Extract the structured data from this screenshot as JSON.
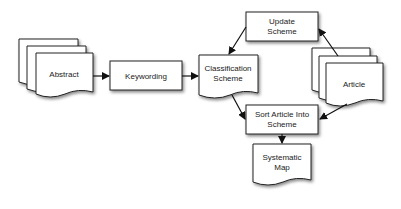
{
  "diagram": {
    "type": "flowchart",
    "nodes": {
      "abstract": {
        "label": "Abstract",
        "shape": "multi-document"
      },
      "keywording": {
        "label": "Keywording",
        "shape": "process"
      },
      "classification": {
        "line1": "Classification",
        "line2": "Scheme",
        "shape": "document"
      },
      "update": {
        "line1": "Update",
        "line2": "Scheme",
        "shape": "process"
      },
      "article": {
        "label": "Article",
        "shape": "multi-document"
      },
      "sort": {
        "line1": "Sort Article Into",
        "line2": "Scheme",
        "shape": "process"
      },
      "map": {
        "line1": "Systematic",
        "line2": "Map",
        "shape": "document"
      }
    },
    "edges": [
      {
        "from": "Abstract",
        "to": "Keywording"
      },
      {
        "from": "Keywording",
        "to": "Classification Scheme"
      },
      {
        "from": "Update Scheme",
        "to": "Classification Scheme"
      },
      {
        "from": "Article",
        "to": "Update Scheme"
      },
      {
        "from": "Classification Scheme",
        "to": "Sort Article Into Scheme"
      },
      {
        "from": "Article",
        "to": "Sort Article Into Scheme"
      },
      {
        "from": "Sort Article Into Scheme",
        "to": "Systematic Map"
      }
    ]
  }
}
